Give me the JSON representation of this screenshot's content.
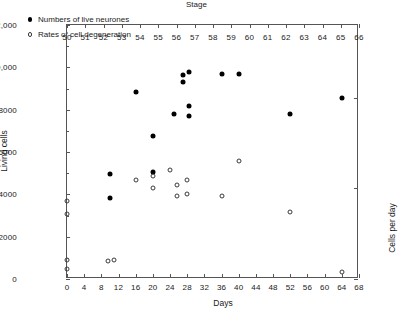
{
  "chart_data": {
    "type": "scatter",
    "title": "",
    "xlabel": "Days",
    "xlabel_top": "Stage",
    "ylabel": "Living cells",
    "ylabel_right": "Cells per day",
    "xlim": [
      0,
      68
    ],
    "ylim": [
      0,
      12000
    ],
    "ylim_right": [
      0,
      1400
    ],
    "xticks": [
      0,
      4,
      8,
      12,
      16,
      20,
      24,
      28,
      32,
      36,
      40,
      44,
      48,
      52,
      56,
      60,
      64,
      68
    ],
    "xticklabels": [
      "0",
      "4",
      "8",
      "12",
      "16",
      "20",
      "24",
      "28",
      "32",
      "36",
      "40",
      "44",
      "48",
      "52",
      "56",
      "60",
      "64",
      "68"
    ],
    "xticks_top": [
      50,
      51,
      52,
      53,
      54,
      55,
      56,
      57,
      58,
      59,
      60,
      61,
      62,
      63,
      64,
      65,
      66
    ],
    "xticklabels_top": [
      "50",
      "51",
      "52",
      "53",
      "54",
      "55",
      "56",
      "57",
      "58",
      "59",
      "60",
      "61",
      "62",
      "63",
      "64",
      "65",
      "66"
    ],
    "yticks": [
      0,
      2000,
      4000,
      6000,
      8000,
      10000,
      12000
    ],
    "yticklabels": [
      "0",
      "2000",
      "4000",
      "6000",
      "8000",
      "10,000",
      "12,000"
    ],
    "yticks_right": [
      0,
      500,
      1000
    ],
    "yticklabels_right": [
      "0",
      "500",
      "1000"
    ],
    "grid": false,
    "legend_position": "top-left",
    "series": [
      {
        "name": "Numbers of live neurones",
        "marker": "filled-circle",
        "axis": "left",
        "points": [
          {
            "x": 10,
            "y": 4950
          },
          {
            "x": 10,
            "y": 3850
          },
          {
            "x": 16,
            "y": 8850
          },
          {
            "x": 20,
            "y": 5050
          },
          {
            "x": 20,
            "y": 6750
          },
          {
            "x": 25,
            "y": 7800
          },
          {
            "x": 27,
            "y": 9650
          },
          {
            "x": 28.5,
            "y": 9800
          },
          {
            "x": 27,
            "y": 9300
          },
          {
            "x": 28.5,
            "y": 8150
          },
          {
            "x": 28.5,
            "y": 7700
          },
          {
            "x": 36,
            "y": 9700
          },
          {
            "x": 40,
            "y": 9700
          },
          {
            "x": 52,
            "y": 7800
          },
          {
            "x": 64,
            "y": 8550
          }
        ]
      },
      {
        "name": "Rates of cell degeneration",
        "marker": "open-circle",
        "axis": "right",
        "points": [
          {
            "x": 0,
            "y": 430
          },
          {
            "x": 0,
            "y": 360
          },
          {
            "x": 0,
            "y": 105
          },
          {
            "x": 0,
            "y": 55
          },
          {
            "x": 9.5,
            "y": 100
          },
          {
            "x": 11,
            "y": 105
          },
          {
            "x": 16,
            "y": 545
          },
          {
            "x": 20,
            "y": 570
          },
          {
            "x": 20,
            "y": 500
          },
          {
            "x": 24,
            "y": 600
          },
          {
            "x": 25.5,
            "y": 520
          },
          {
            "x": 25.5,
            "y": 455
          },
          {
            "x": 28,
            "y": 545
          },
          {
            "x": 28,
            "y": 470
          },
          {
            "x": 36,
            "y": 455
          },
          {
            "x": 40,
            "y": 650
          },
          {
            "x": 52,
            "y": 370
          },
          {
            "x": 64,
            "y": 40
          }
        ]
      }
    ]
  }
}
